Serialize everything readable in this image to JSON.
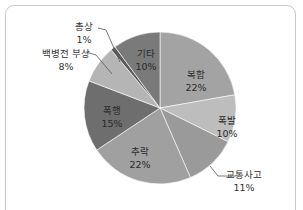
{
  "chart_data": {
    "type": "pie",
    "title": "",
    "start_angle": "12 o'clock",
    "direction": "clockwise",
    "slices": [
      {
        "label": "복합",
        "value": 22,
        "display": "22%",
        "color": "#a3a3a3"
      },
      {
        "label": "폭발",
        "value": 10,
        "display": "10%",
        "color": "#bdbdbd"
      },
      {
        "label": "교통사고",
        "value": 11,
        "display": "11%",
        "color": "#9a9a9a"
      },
      {
        "label": "추락",
        "value": 22,
        "display": "22%",
        "color": "#a0a0a0"
      },
      {
        "label": "폭행",
        "value": 15,
        "display": "15%",
        "color": "#6e6e6e"
      },
      {
        "label": "백병전 부상",
        "value": 8,
        "display": "8%",
        "color": "#b5b5b5"
      },
      {
        "label": "총상",
        "value": 1,
        "display": "1%",
        "color": "#5a5a5a"
      },
      {
        "label": "기타",
        "value": 10,
        "display": "10%",
        "color": "#7a7a7a"
      }
    ],
    "legend": "none (labels on slices / leader lines)"
  }
}
